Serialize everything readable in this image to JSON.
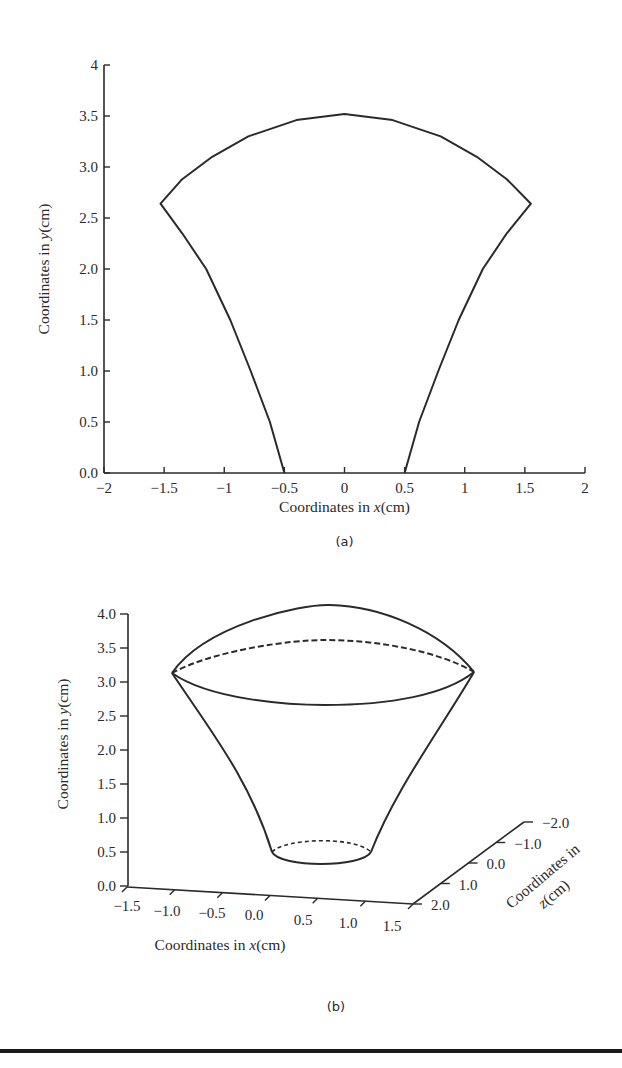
{
  "chart_data": [
    {
      "id": "a",
      "type": "line",
      "caption": "(a)",
      "title": "",
      "xlabel": "Coordinates in x(cm)",
      "xlabel_parts": [
        "Coordinates in ",
        "x",
        "(cm)"
      ],
      "ylabel": "Coordinates in y(cm)",
      "ylabel_parts": [
        "Coordinates in ",
        "y",
        "(cm)"
      ],
      "xlim": [
        -2,
        2
      ],
      "ylim": [
        0,
        4
      ],
      "xticks": [
        "−2",
        "−1.5",
        "−1",
        "−0.5",
        "0",
        "0.5",
        "1",
        "1.5",
        "2"
      ],
      "xtick_values": [
        -2,
        -1.5,
        -1,
        -0.5,
        0,
        0.5,
        1,
        1.5,
        2
      ],
      "yticks": [
        "0.0",
        "0.5",
        "1.0",
        "1.5",
        "2.0",
        "2.5",
        "3.0",
        "3.5",
        "4"
      ],
      "ytick_values": [
        0,
        0.5,
        1.0,
        1.5,
        2.0,
        2.5,
        3.0,
        3.5,
        4
      ],
      "grid": false,
      "series": [
        {
          "name": "outline",
          "style": "solid",
          "points": [
            [
              -0.5,
              0.0
            ],
            [
              -0.62,
              0.5
            ],
            [
              -0.78,
              1.0
            ],
            [
              -0.95,
              1.5
            ],
            [
              -1.15,
              2.0
            ],
            [
              -1.35,
              2.35
            ],
            [
              -1.53,
              2.64
            ],
            [
              -1.35,
              2.88
            ],
            [
              -1.1,
              3.1
            ],
            [
              -0.8,
              3.3
            ],
            [
              -0.4,
              3.46
            ],
            [
              0.0,
              3.52
            ],
            [
              0.4,
              3.46
            ],
            [
              0.8,
              3.3
            ],
            [
              1.1,
              3.1
            ],
            [
              1.35,
              2.88
            ],
            [
              1.55,
              2.64
            ],
            [
              1.35,
              2.35
            ],
            [
              1.15,
              2.0
            ],
            [
              0.95,
              1.5
            ],
            [
              0.78,
              1.0
            ],
            [
              0.62,
              0.5
            ],
            [
              0.5,
              0.0
            ]
          ]
        }
      ]
    },
    {
      "id": "b",
      "type": "line",
      "projection": "3d",
      "caption": "(b)",
      "title": "",
      "xlabel": "Coordinates in x(cm)",
      "xlabel_parts": [
        "Coordinates in ",
        "x",
        "(cm)"
      ],
      "ylabel": "Coordinates in y(cm)",
      "ylabel_parts": [
        "Coordinates in ",
        "y",
        "(cm)"
      ],
      "zlabel": "Coordinates in z(cm)",
      "zlabel_lines": [
        "Coordinates in",
        "z(cm)"
      ],
      "xlim": [
        -1.5,
        1.5
      ],
      "ylim": [
        0,
        4.0
      ],
      "zlim": [
        2.0,
        -2.0
      ],
      "xticks": [
        "−1.5",
        "−1.0",
        "−0.5",
        "0.0",
        "0.5",
        "1.0",
        "1.5"
      ],
      "xtick_values": [
        -1.5,
        -1.0,
        -0.5,
        0.0,
        0.5,
        1.0,
        1.5
      ],
      "yticks": [
        "0.0",
        "0.5",
        "1.0",
        "1.5",
        "2.0",
        "2.5",
        "3.0",
        "3.5",
        "4.0"
      ],
      "ytick_values": [
        0,
        0.5,
        1.0,
        1.5,
        2.0,
        2.5,
        3.0,
        3.5,
        4.0
      ],
      "zticks": [
        "2.0",
        "1.0",
        "0.0",
        "−1.0",
        "−2.0"
      ],
      "ztick_values": [
        2.0,
        1.0,
        0.0,
        -1.0,
        -2.0
      ],
      "grid": false,
      "surface": {
        "description": "Surface of revolution (funnel/cone) with domed cap",
        "bottom_circle_y": 0.5,
        "bottom_radius": 0.5,
        "top_rim_y": 3.1,
        "top_radius": 1.5,
        "cap_apex_y": 4.0
      },
      "series": [
        {
          "name": "cap-front-outline",
          "style": "solid"
        },
        {
          "name": "top-rim-back",
          "style": "dashed"
        },
        {
          "name": "top-rim-front",
          "style": "solid"
        },
        {
          "name": "side-left",
          "style": "solid"
        },
        {
          "name": "side-right",
          "style": "solid"
        },
        {
          "name": "bottom-rim-back",
          "style": "dashed"
        },
        {
          "name": "bottom-rim-front",
          "style": "solid"
        }
      ]
    }
  ],
  "colors": {
    "line": "#2a2a2a",
    "background": "#ffffff",
    "rule": "#1a1a1a"
  }
}
